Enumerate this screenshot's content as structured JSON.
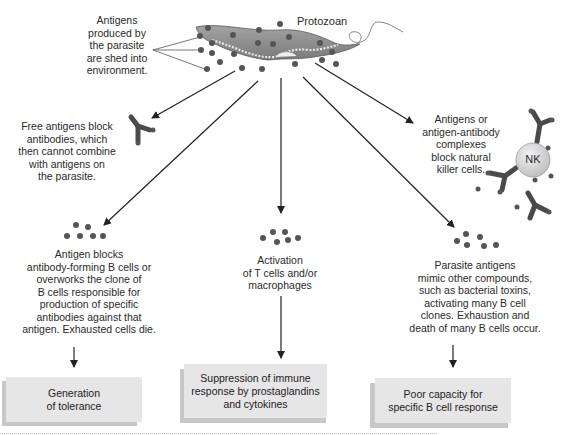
{
  "title_label": "Protozoan",
  "shed_label": [
    "Antigens",
    "produced by",
    "the parasite",
    "are shed into",
    "environment."
  ],
  "mechanisms": {
    "free_antigens": [
      "Free antigens block",
      "antibodies, which",
      "then cannot combine",
      "with antigens on",
      "the parasite."
    ],
    "nk_block": [
      "Antigens or",
      "antigen-antibody",
      "complexes",
      "block natural",
      "killer cells."
    ],
    "nk_cell_label": "NK",
    "b_cell_block": [
      "Antigen blocks",
      "antibody-forming B cells or",
      "overworks the clone of",
      "B cells responsible for",
      "production of specific",
      "antibodies against that",
      "antigen. Exhausted cells die."
    ],
    "t_cell_activation": [
      "Activation",
      "of T cells and/or",
      "macrophages"
    ],
    "mimicry": [
      "Parasite antigens",
      "mimic other compounds,",
      "such as bacterial toxins,",
      "activating many B cell",
      "clones. Exhaustion and",
      "death of many B cells occur."
    ]
  },
  "outcomes": [
    {
      "lines": [
        "Generation",
        "of tolerance"
      ]
    },
    {
      "lines": [
        "Suppression of immune",
        "response by prostaglandins",
        "and cytokines"
      ]
    },
    {
      "lines": [
        "Poor capacity for",
        "specific B cell response"
      ]
    }
  ],
  "colors": {
    "antigen_dot": "#555555",
    "parasite_body": "#8c8c8c",
    "antibody": "#4a4a4a",
    "nk_cell": "#dcdcdc",
    "box_fill": "#e6e6e6",
    "box_shadow": "#c7c7c7",
    "arrow": "#222222"
  }
}
